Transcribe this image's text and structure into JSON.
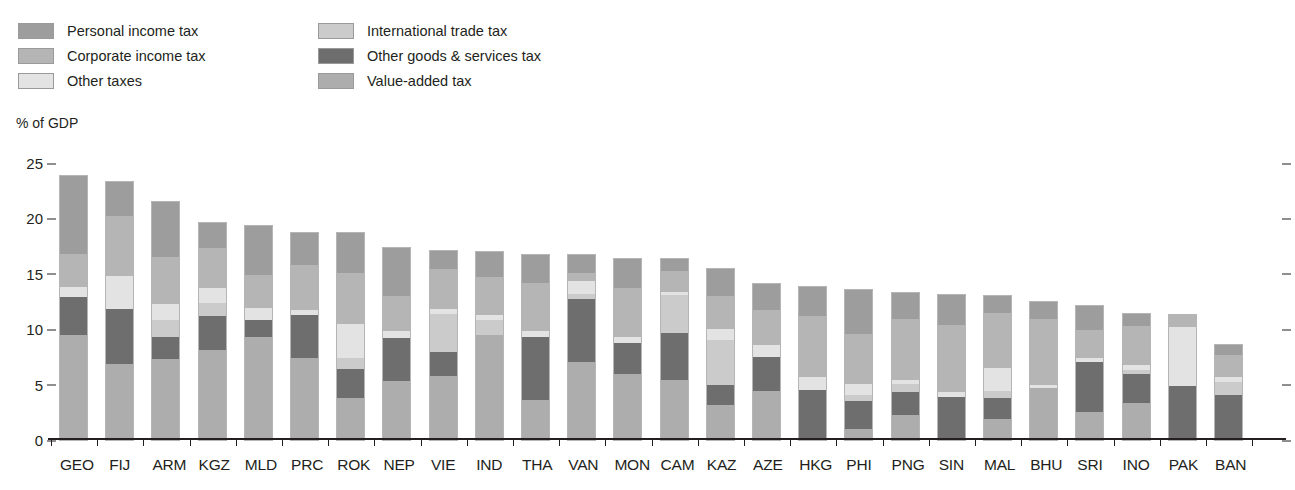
{
  "legend": {
    "columns": [
      {
        "items": [
          {
            "label": "Personal income tax",
            "key": "personal_income_tax",
            "color": "#9d9d9d"
          },
          {
            "label": "Corporate income tax",
            "key": "corporate_income_tax",
            "color": "#b5b5b5"
          },
          {
            "label": "Other taxes",
            "key": "other_taxes",
            "color": "#e3e3e3"
          }
        ]
      },
      {
        "items": [
          {
            "label": "International trade tax",
            "key": "international_trade_tax",
            "color": "#cbcbcb"
          },
          {
            "label": "Other goods & services tax",
            "key": "other_goods_services_tax",
            "color": "#6e6e6e"
          },
          {
            "label": "Value-added tax",
            "key": "value_added_tax",
            "color": "#adadad"
          }
        ]
      }
    ]
  },
  "axis": {
    "y_title": "% of GDP",
    "y_ticks": [
      0,
      5,
      10,
      15,
      20,
      25
    ],
    "y_min": 0,
    "y_max": 25
  },
  "chart_data": {
    "type": "bar",
    "title": "",
    "subtitle": "",
    "xlabel": "",
    "ylabel": "% of GDP",
    "ylim": [
      0,
      25
    ],
    "grid": false,
    "stacked": true,
    "legend_position": "top-left",
    "categories": [
      "GEO",
      "FIJ",
      "ARM",
      "KGZ",
      "MLD",
      "PRC",
      "ROK",
      "NEP",
      "VIE",
      "IND",
      "THA",
      "VAN",
      "MON",
      "CAM",
      "KAZ",
      "AZE",
      "HKG",
      "PHI",
      "PNG",
      "SIN",
      "MAL",
      "BHU",
      "SRI",
      "INO",
      "PAK",
      "BAN"
    ],
    "series": [
      {
        "name": "Value-added tax",
        "color": "#adadad",
        "values": [
          9.5,
          6.9,
          7.3,
          8.1,
          9.3,
          7.4,
          3.8,
          5.3,
          5.8,
          9.5,
          3.6,
          7.0,
          6.0,
          5.4,
          3.2,
          4.4,
          0.0,
          1.0,
          2.3,
          0.0,
          1.9,
          4.7,
          2.5,
          3.3,
          0.0,
          0.0
        ]
      },
      {
        "name": "Other goods & services tax",
        "color": "#6e6e6e",
        "values": [
          3.4,
          4.9,
          2.0,
          3.1,
          1.5,
          3.9,
          2.6,
          3.9,
          2.1,
          0.0,
          5.7,
          5.7,
          2.8,
          4.3,
          1.8,
          3.1,
          4.5,
          2.5,
          2.0,
          3.9,
          1.9,
          0.0,
          4.5,
          2.7,
          4.9,
          4.1
        ]
      },
      {
        "name": "International trade tax",
        "color": "#cbcbcb",
        "values": [
          0.0,
          0.0,
          1.5,
          1.2,
          0.0,
          0.0,
          1.0,
          0.0,
          3.5,
          1.3,
          0.0,
          0.5,
          0.0,
          3.4,
          4.0,
          0.0,
          0.0,
          0.6,
          0.8,
          0.0,
          0.6,
          0.0,
          0.0,
          0.3,
          0.0,
          1.1
        ]
      },
      {
        "name": "Other taxes",
        "color": "#e3e3e3",
        "values": [
          0.9,
          3.0,
          1.5,
          1.3,
          1.1,
          0.4,
          3.1,
          0.6,
          0.4,
          0.5,
          0.5,
          1.2,
          0.5,
          0.3,
          1.0,
          1.1,
          1.2,
          1.0,
          0.3,
          0.4,
          2.1,
          0.3,
          0.4,
          0.5,
          5.3,
          0.5
        ]
      },
      {
        "name": "Corporate income tax",
        "color": "#b5b5b5",
        "values": [
          3.0,
          5.4,
          4.2,
          3.6,
          3.0,
          4.1,
          4.6,
          3.2,
          3.6,
          3.4,
          4.4,
          0.7,
          4.4,
          1.9,
          3.0,
          3.1,
          5.5,
          4.5,
          5.5,
          6.1,
          5.0,
          5.9,
          2.5,
          3.5,
          1.1,
          2.0
        ]
      },
      {
        "name": "Personal income tax",
        "color": "#9d9d9d",
        "values": [
          7.0,
          3.1,
          5.0,
          2.3,
          4.4,
          2.9,
          3.6,
          4.3,
          1.7,
          2.3,
          2.5,
          1.6,
          2.6,
          1.0,
          2.4,
          2.4,
          2.6,
          3.9,
          2.4,
          2.7,
          1.5,
          1.6,
          2.2,
          1.1,
          0.0,
          0.9
        ]
      }
    ]
  }
}
